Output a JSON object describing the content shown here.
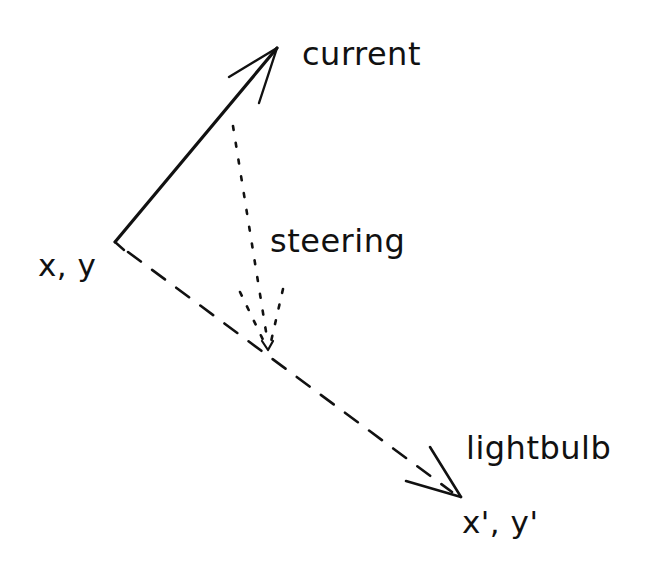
{
  "diagram": {
    "title": "",
    "stroke_color": "#111111",
    "background": "#ffffff",
    "nodes": [
      {
        "id": "origin",
        "label": "x, y"
      },
      {
        "id": "current",
        "label": "current"
      },
      {
        "id": "steering",
        "label": "steering"
      },
      {
        "id": "lightbulb",
        "label": "lightbulb"
      },
      {
        "id": "target",
        "label": "x', y'"
      }
    ],
    "edges": [
      {
        "from": "origin",
        "to": "current",
        "style": "solid",
        "label": "current"
      },
      {
        "from": "origin",
        "to": "target",
        "style": "dashed",
        "label": "lightbulb"
      },
      {
        "from": "current",
        "to": "dashed-line",
        "style": "dotted",
        "label": "steering"
      }
    ]
  },
  "labels": {
    "origin": "x, y",
    "current": "current",
    "steering": "steering",
    "lightbulb": "lightbulb",
    "target": "x', y'"
  }
}
